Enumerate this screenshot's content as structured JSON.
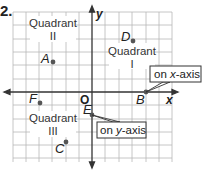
{
  "problem_number": "2.",
  "axes": {
    "x_label": "x",
    "y_label": "y",
    "origin_label": "O"
  },
  "quadrants": [
    {
      "id": "II",
      "line1": "Quadrant",
      "line2": "II"
    },
    {
      "id": "I",
      "line1": "Quadrant",
      "line2": "I"
    },
    {
      "id": "III",
      "line1": "Quadrant",
      "line2": "III"
    }
  ],
  "points": [
    {
      "label": "A",
      "location": "Quadrant II"
    },
    {
      "label": "D",
      "location": "Quadrant I"
    },
    {
      "label": "F",
      "location": "Quadrant III"
    },
    {
      "label": "E",
      "location": "on y-axis"
    },
    {
      "label": "B",
      "location": "on x-axis"
    },
    {
      "label": "C",
      "location": "Quadrant III"
    }
  ],
  "callouts": {
    "x_axis": {
      "prefix": "on ",
      "axis": "x",
      "suffix": "-axis"
    },
    "y_axis": {
      "prefix": "on ",
      "axis": "y",
      "suffix": "-axis"
    }
  },
  "colors": {
    "grid": "#b8b8b8",
    "axis": "#333333",
    "point": "#555555",
    "callout_border": "#333333"
  }
}
